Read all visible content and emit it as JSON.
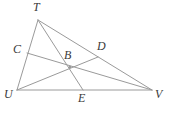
{
  "figure": {
    "type": "geometry-diagram",
    "width": 171,
    "height": 113,
    "background_color": "#ffffff",
    "line_color": "#9a9a9a",
    "label_color": "#3a3a3a",
    "line_width": 1
  },
  "points": [
    {
      "id": "T",
      "label": "T",
      "x": 38,
      "y": 20,
      "label_x": 33,
      "label_y": 1,
      "role": "triangle-vertex"
    },
    {
      "id": "U",
      "label": "U",
      "x": 17,
      "y": 90,
      "label_x": 4,
      "label_y": 88,
      "role": "triangle-vertex"
    },
    {
      "id": "V",
      "label": "V",
      "x": 152,
      "y": 90,
      "label_x": 155,
      "label_y": 88,
      "role": "triangle-vertex"
    },
    {
      "id": "C",
      "label": "C",
      "x": 27,
      "y": 53,
      "label_x": 13,
      "label_y": 43,
      "role": "point-on-side-TU"
    },
    {
      "id": "D",
      "label": "D",
      "x": 98,
      "y": 57,
      "label_x": 97,
      "label_y": 40,
      "role": "point-on-side-TV"
    },
    {
      "id": "E",
      "label": "E",
      "x": 83,
      "y": 90,
      "label_x": 78,
      "label_y": 92,
      "role": "point-on-side-UV"
    },
    {
      "id": "B",
      "label": "B",
      "x": 70,
      "y": 67,
      "label_x": 64,
      "label_y": 49,
      "role": "intersection-point"
    }
  ],
  "segments": [
    {
      "id": "TU",
      "from": "T",
      "to": "U",
      "kind": "triangle-side"
    },
    {
      "id": "UV",
      "from": "U",
      "to": "V",
      "kind": "triangle-side"
    },
    {
      "id": "TV",
      "from": "T",
      "to": "V",
      "kind": "triangle-side"
    },
    {
      "id": "TE",
      "from": "T",
      "to": "E",
      "kind": "cevian"
    },
    {
      "id": "UD",
      "from": "U",
      "to": "D",
      "kind": "cevian"
    },
    {
      "id": "VC",
      "from": "V",
      "to": "C",
      "kind": "cevian"
    }
  ]
}
